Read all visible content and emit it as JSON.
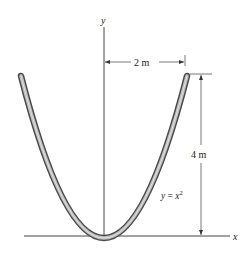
{
  "diagram": {
    "axes": {
      "x_label": "x",
      "y_label": "y"
    },
    "rod": {
      "equation_prefix": "y = ",
      "equation_var": "x",
      "equation_exp": "2",
      "fill_color": "#b5b5b5",
      "edge_color": "#4a4a4a"
    },
    "dimensions": {
      "width_label": "2 m",
      "height_label": "4 m"
    }
  }
}
